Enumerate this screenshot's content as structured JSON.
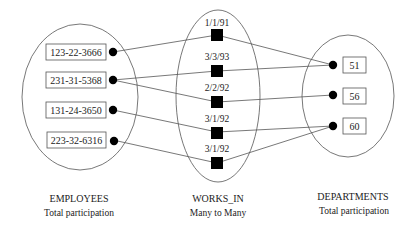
{
  "employees": {
    "title": "EMPLOYEES",
    "subtitle": "Total participation",
    "items": [
      "123-22-3666",
      "231-31-5368",
      "131-24-3650",
      "223-32-6316"
    ]
  },
  "works_in": {
    "title": "WORKS_IN",
    "subtitle": "Many to Many",
    "dates": [
      "1/1/91",
      "3/3/93",
      "2/2/92",
      "3/1/92",
      "3/1/92"
    ]
  },
  "departments": {
    "title": "DEPARTMENTS",
    "subtitle": "Total participation",
    "items": [
      "51",
      "56",
      "60"
    ]
  },
  "relationships": [
    {
      "employee": "123-22-3666",
      "since": "1/1/91",
      "department": "51"
    },
    {
      "employee": "231-31-5368",
      "since": "3/3/93",
      "department": "51"
    },
    {
      "employee": "231-31-5368",
      "since": "2/2/92",
      "department": "56"
    },
    {
      "employee": "131-24-3650",
      "since": "3/1/92",
      "department": "60"
    },
    {
      "employee": "223-32-6316",
      "since": "3/1/92",
      "department": "60"
    }
  ]
}
